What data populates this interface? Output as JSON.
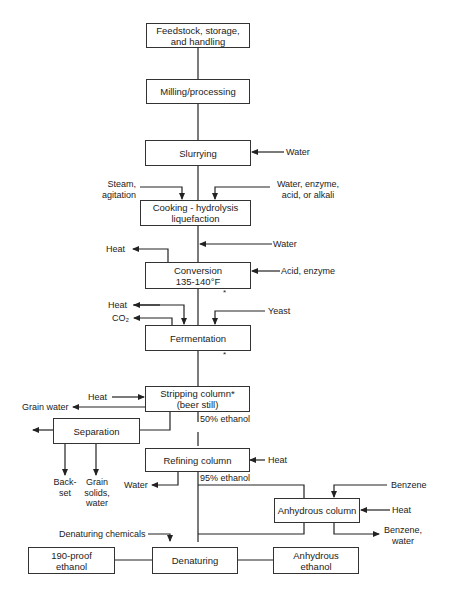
{
  "diagram": {
    "type": "process-flowchart",
    "nodes": {
      "feedstock": "Feedstock, storage,\nand handling",
      "milling": "Milling/processing",
      "slurrying": "Slurrying",
      "cooking": "Cooking - hydrolysis\nliquefaction",
      "conversion": "Conversion\n135-140°F",
      "fermentation": "Fermentation",
      "stripping": "Stripping column*\n(beer still)",
      "separation": "Separation",
      "refining": "Refining column",
      "anhydrous_column": "Anhydrous column",
      "denaturing": "Denaturing",
      "proof190": "190-proof\nethanol",
      "anhydrous_ethanol": "Anhydrous\nethanol"
    },
    "labels": {
      "slurry_water": "Water",
      "steam": "Steam,\nagitation",
      "water_enzyme": "Water, enzyme,\nacid, or alkali",
      "cook_water": "Water",
      "conv_heat": "Heat",
      "acid_enzyme": "Acid, enzyme",
      "ferm_heat": "Heat",
      "co2": "CO₂",
      "yeast": "Yeast",
      "strip_heat": "Heat",
      "grain_water": "Grain water",
      "ethanol50": "50% ethanol",
      "backset": "Back-\nset",
      "grain_solids": "Grain\nsolids,\nwater",
      "refine_heat": "Heat",
      "refine_water": "Water",
      "ethanol95": "95% ethanol",
      "benzene_in": "Benzene",
      "anhyd_heat": "Heat",
      "benzene_water": "Benzene,\nwater",
      "denat_chem": "Denaturing chemicals",
      "asterisk": "*"
    }
  }
}
